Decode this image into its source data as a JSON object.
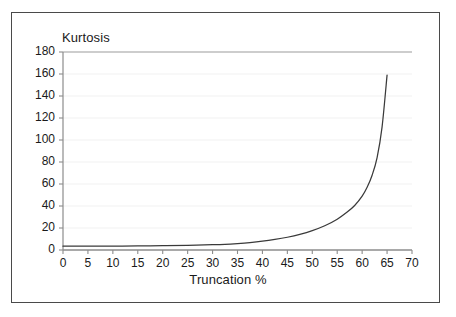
{
  "figure": {
    "background_color": "#ffffff",
    "frame_color": "#4a4a4a",
    "curve_color": "#3a3a3a",
    "axis_color": "#8c8c8c",
    "gridline_color": "#f2f2f2",
    "top_gridline_color": "#bdbdbd"
  },
  "chart_data": {
    "type": "line",
    "title": "",
    "subtitle": "",
    "xlabel": "Truncation %",
    "ylabel": "Kurtosis",
    "xlim": [
      0,
      70
    ],
    "ylim": [
      0,
      180
    ],
    "xticks": [
      0,
      5,
      10,
      15,
      20,
      25,
      30,
      35,
      40,
      45,
      50,
      55,
      60,
      65,
      70
    ],
    "yticks": [
      0,
      20,
      40,
      60,
      80,
      100,
      120,
      140,
      160,
      180
    ],
    "xtick_labels": [
      "0",
      "5",
      "10",
      "15",
      "20",
      "25",
      "30",
      "35",
      "40",
      "45",
      "50",
      "55",
      "60",
      "65",
      "70"
    ],
    "ytick_labels": [
      "0",
      "20",
      "40",
      "60",
      "80",
      "100",
      "120",
      "140",
      "160",
      "180"
    ],
    "grid": true,
    "grid_axis": "y",
    "legend": false,
    "legend_position": "none",
    "annotations": [],
    "series": [
      {
        "name": "Kurtosis vs Truncation",
        "x": [
          0,
          5,
          10,
          15,
          20,
          25,
          30,
          32.5,
          35,
          37.5,
          40,
          42.5,
          45,
          47.5,
          50,
          52.5,
          55,
          57,
          58.5,
          60,
          61,
          62,
          63,
          64,
          65
        ],
        "values": [
          3.5,
          3.5,
          3.6,
          3.7,
          3.9,
          4.2,
          4.8,
          5.2,
          5.9,
          6.8,
          8.0,
          9.6,
          11.6,
          14.2,
          17.6,
          22.0,
          28.0,
          34.5,
          40.5,
          49.0,
          57.0,
          68.0,
          84.0,
          112.0,
          159.0
        ]
      }
    ]
  },
  "labels": {
    "y_axis_title": "Kurtosis",
    "x_axis_title": "Truncation %"
  }
}
